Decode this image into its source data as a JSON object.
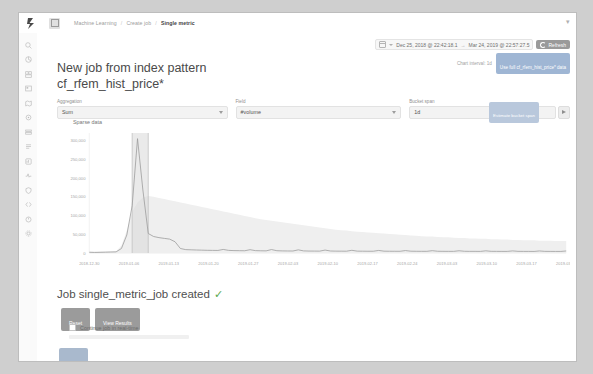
{
  "window": {
    "topbar": {
      "logo_icon": "elastic-logo-icon",
      "app_icon": "ml-app-icon",
      "collapse_icon": "chevron-collapse-icon",
      "breadcrumbs": [
        {
          "label": "Machine Learning",
          "active": false
        },
        {
          "label": "/",
          "active": false
        },
        {
          "label": "Create job",
          "active": false
        },
        {
          "label": "/",
          "active": false
        },
        {
          "label": "Single metric",
          "active": true
        }
      ]
    },
    "sidebar": {
      "items": [
        {
          "name": "discover",
          "icon": "discover-icon"
        },
        {
          "name": "visualize",
          "icon": "visualize-icon"
        },
        {
          "name": "dashboard",
          "icon": "dashboard-icon"
        },
        {
          "name": "canvas",
          "icon": "canvas-icon"
        },
        {
          "name": "maps",
          "icon": "maps-icon"
        },
        {
          "name": "machine-learning",
          "icon": "ml-icon"
        },
        {
          "name": "infrastructure",
          "icon": "infrastructure-icon"
        },
        {
          "name": "logs",
          "icon": "logs-icon"
        },
        {
          "name": "apm",
          "icon": "apm-icon"
        },
        {
          "name": "uptime",
          "icon": "uptime-icon"
        },
        {
          "name": "siem",
          "icon": "siem-icon"
        },
        {
          "name": "dev-tools",
          "icon": "wrench-icon"
        },
        {
          "name": "monitoring",
          "icon": "monitoring-icon"
        },
        {
          "name": "management",
          "icon": "gear-icon"
        }
      ]
    },
    "timepicker": {
      "calendar_icon": "calendar-icon",
      "caret_icon": "chevron-down-icon",
      "start": "Dec 25, 2018 @ 22:42:18.1",
      "separator": "→",
      "end": "Mar 24, 2019 @ 22:57:27.5",
      "refresh_label": "Refresh",
      "refresh_icon": "refresh-icon"
    },
    "chart_interval": {
      "label": "Chart interval: 1d",
      "use_full_data_label": "Use full cf_rfem_hist_price* data"
    },
    "title": {
      "line1": "New job from index pattern",
      "line2": "cf_rfem_hist_price*"
    },
    "form": {
      "aggregation": {
        "label": "Aggregation",
        "value": "Sum",
        "caret_icon": "chevron-down-icon"
      },
      "field": {
        "label": "Field",
        "value": "#volume",
        "caret_icon": "chevron-down-icon"
      },
      "bucket_span": {
        "label": "Bucket span",
        "value": "1d",
        "estimate_label": "Estimate bucket span",
        "play_icon": "play-icon"
      }
    },
    "chart_annotation": "Sparse data",
    "results": {
      "created_text": "Job single_metric_job created",
      "check_icon": "check-icon",
      "reset_label": "Reset",
      "view_results_label": "View Results",
      "realtime_label": "Continue job in real-time",
      "realtime_checkbox_icon": "checkbox-icon",
      "apply_label": "Apply"
    }
  },
  "chart_data": {
    "type": "area",
    "title": "",
    "xlabel": "",
    "ylabel": "",
    "ylim": [
      0,
      320000
    ],
    "yticks": [
      0,
      50000,
      100000,
      150000,
      200000,
      250000,
      300000
    ],
    "yticklabels": [
      "0",
      "50,000",
      "100,000",
      "150,000",
      "200,000",
      "250,000",
      "300,000"
    ],
    "grid": false,
    "legend": "none",
    "xticklabels": [
      "2018-12-30",
      "2019-01-06",
      "2019-01-13",
      "2019-01-20",
      "2019-01-27",
      "2019-02-03",
      "2019-02-10",
      "2019-02-17",
      "2019-02-24",
      "2019-03-03",
      "2019-03-10",
      "2019-03-17",
      "2019-03-24"
    ],
    "series": [
      {
        "name": "Sum of #volume",
        "values": [
          2000,
          1500,
          1800,
          2200,
          2600,
          3000,
          12000,
          48000,
          126000,
          305000,
          168000,
          52000,
          44000,
          41000,
          39000,
          37000,
          30000,
          12000,
          9000,
          8500,
          8000,
          7600,
          7200,
          7000,
          6800,
          9500,
          7000,
          6400,
          6200,
          6000,
          8800,
          6300,
          5900,
          5700,
          9200,
          6100,
          5600,
          5400,
          5300,
          8400,
          5600,
          5200,
          5100,
          5000,
          7800,
          5300,
          5000,
          4900,
          4800,
          7200,
          5000,
          4800,
          4700,
          4700,
          6800,
          4900,
          4700,
          4600,
          4600,
          6500,
          4800,
          4600,
          4500,
          4500,
          6200,
          4700,
          4500,
          4400,
          4400,
          6000,
          4600,
          4400,
          4400,
          4300,
          5800,
          4500,
          4400,
          4300,
          4300,
          5600,
          4500,
          4300,
          4300,
          4200,
          5500,
          4400,
          4300,
          4200,
          4200,
          5400
        ]
      },
      {
        "name": "model bounds upper",
        "values": [
          4000,
          3500,
          3800,
          4200,
          4600,
          5000,
          20000,
          60000,
          110000,
          135000,
          148000,
          152000,
          150000,
          147000,
          144000,
          141000,
          138000,
          135000,
          132000,
          129000,
          126000,
          123000,
          120000,
          117000,
          114000,
          111000,
          108000,
          105000,
          102000,
          99000,
          96000,
          93000,
          90000,
          88000,
          86000,
          84000,
          82000,
          80000,
          78000,
          76000,
          74000,
          72000,
          70000,
          68000,
          66000,
          64000,
          62000,
          61000,
          60000,
          58000,
          57000,
          56000,
          55000,
          54000,
          53000,
          52000,
          51000,
          50000,
          49000,
          48000,
          47000,
          46000,
          45000,
          44000,
          44000,
          43000,
          42000,
          42000,
          41000,
          40000,
          40000,
          39000,
          39000,
          38000,
          38000,
          37000,
          37000,
          36000,
          36000,
          35000,
          35000,
          34000,
          34000,
          34000,
          33000,
          33000,
          33000,
          32000,
          32000,
          32000
        ]
      }
    ],
    "annotations": [
      {
        "text": "Sparse data",
        "x_index": 0
      },
      {
        "text": "selection-highlight",
        "x_index_start": 8,
        "x_index_end": 11
      }
    ]
  }
}
